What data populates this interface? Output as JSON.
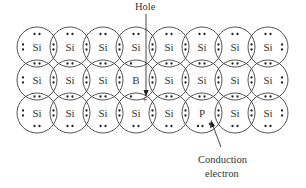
{
  "diagram": {
    "grid": {
      "rows": 3,
      "cols": 8
    },
    "atoms": [
      [
        "Si",
        "Si",
        "Si",
        "Si",
        "Si",
        "Si",
        "Si",
        "Si"
      ],
      [
        "Si",
        "Si",
        "Si",
        "B",
        "Si",
        "Si",
        "Si",
        "Si"
      ],
      [
        "Si",
        "Si",
        "Si",
        "Si",
        "Si",
        "P",
        "Si",
        "Si"
      ]
    ],
    "annotations": {
      "hole_label": "Hole",
      "hole_symbol": "+",
      "conduction_line1": "Conduction",
      "conduction_line2": "electron"
    },
    "colors": {
      "stroke": "#555555",
      "text": "#333333",
      "dot": "#222222"
    }
  }
}
